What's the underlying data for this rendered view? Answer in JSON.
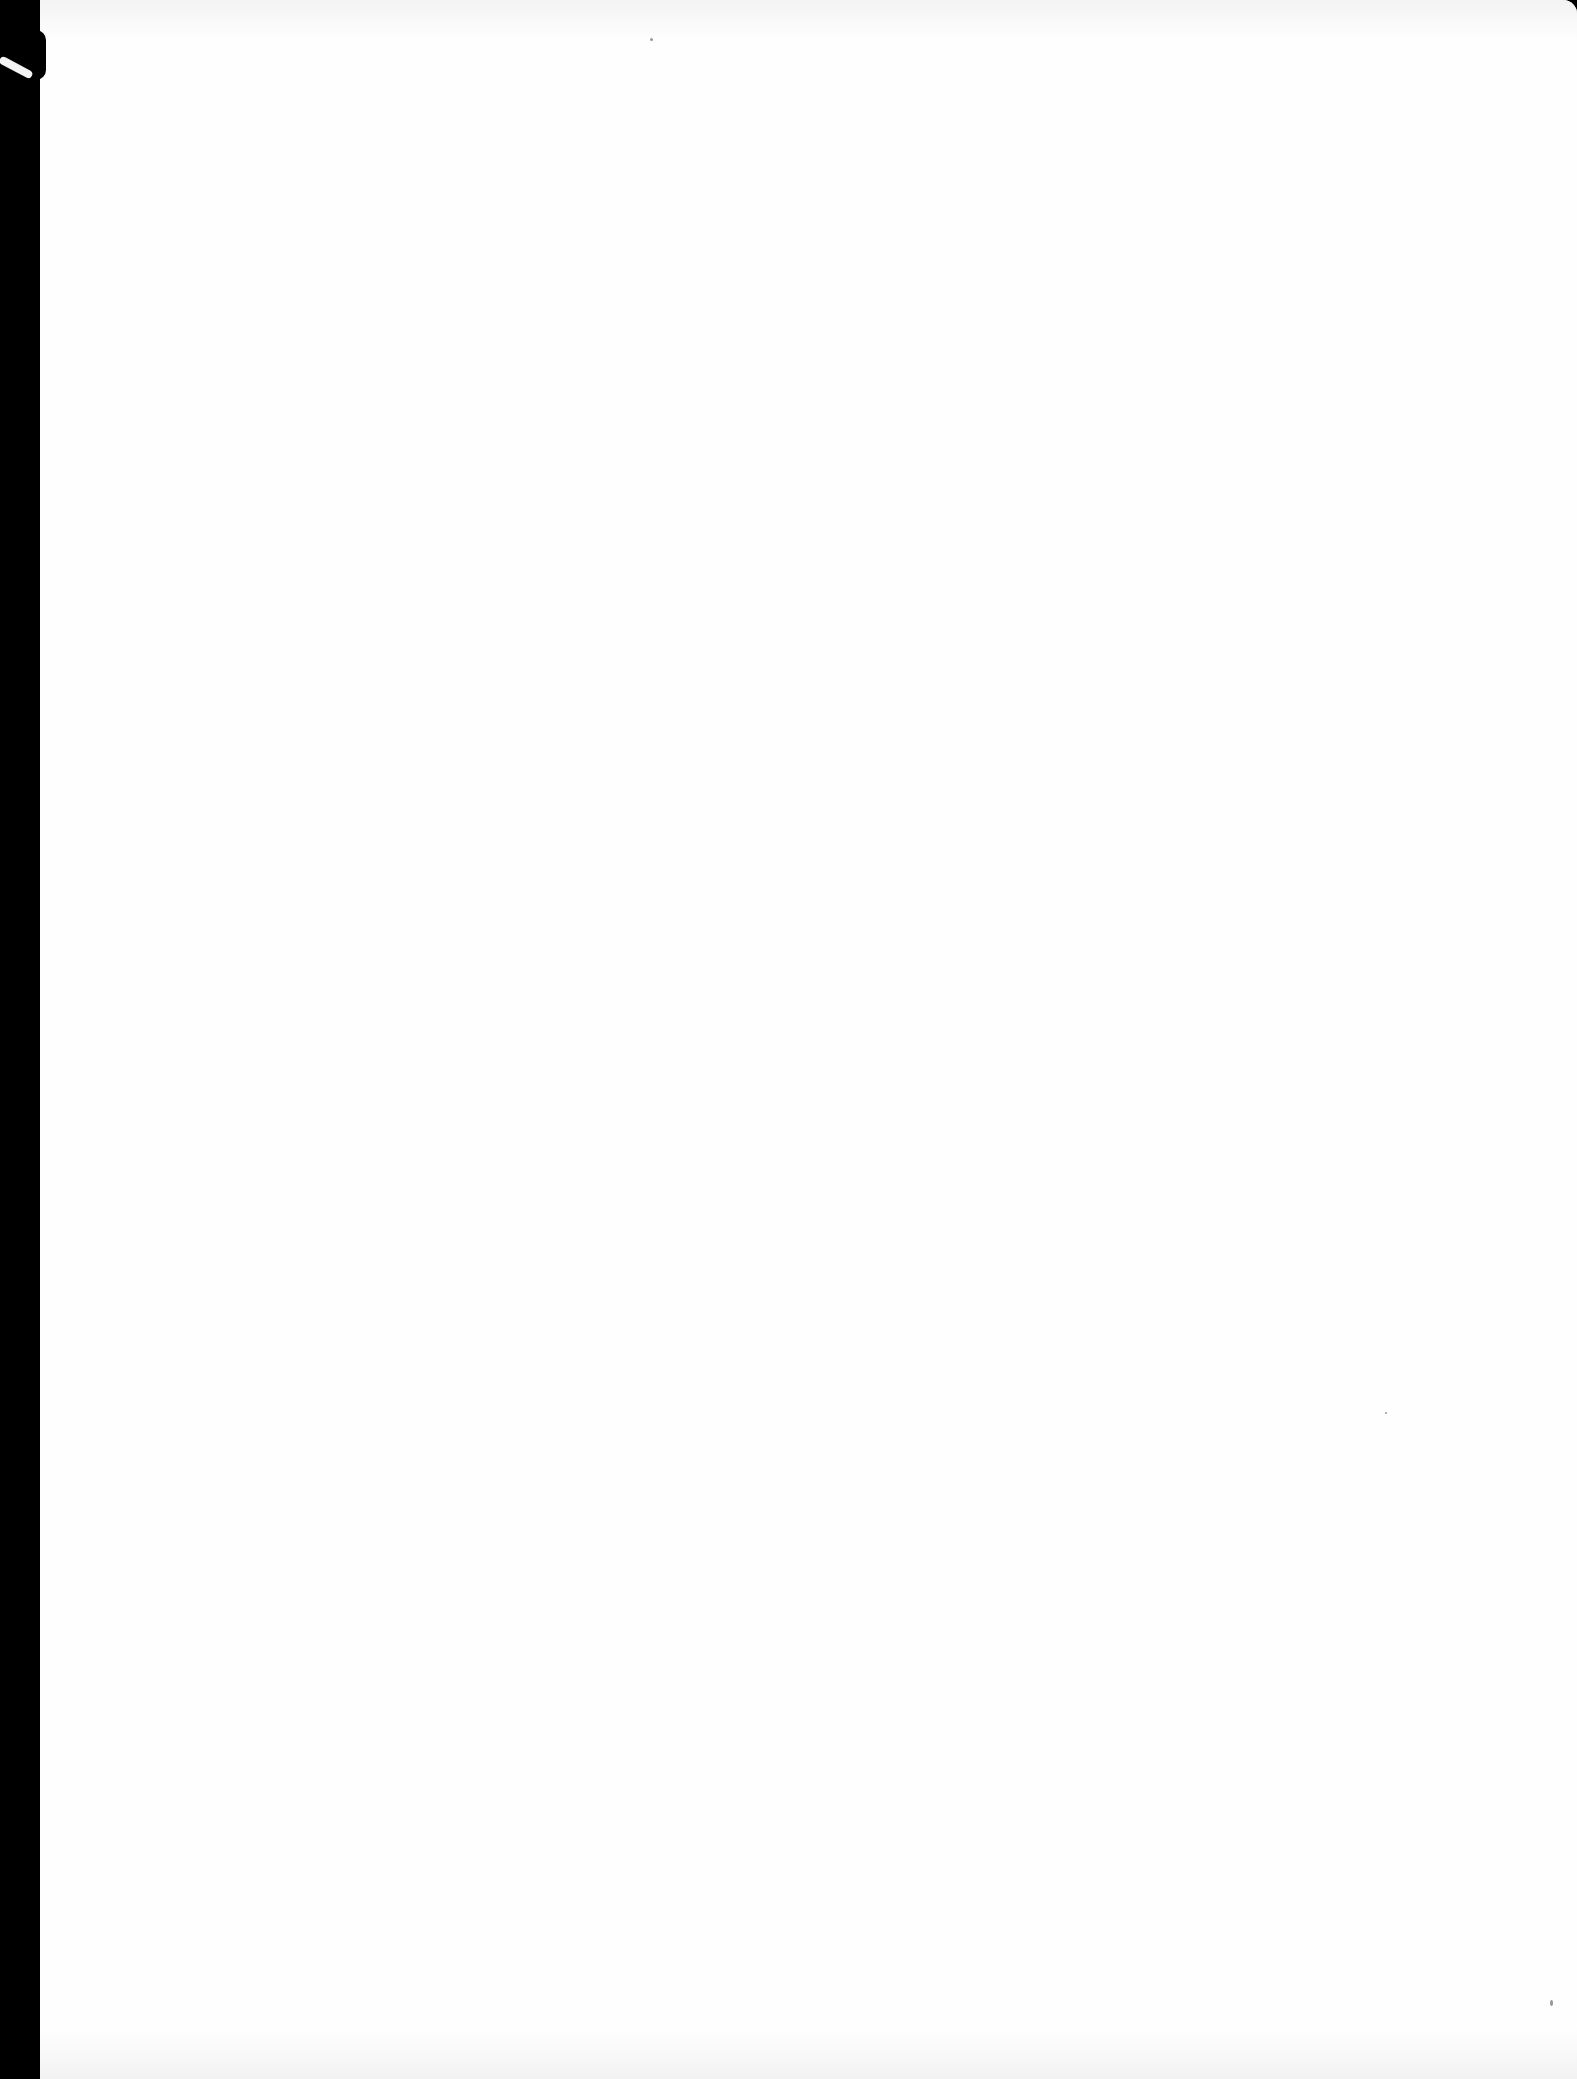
{
  "document": {
    "type": "scanned-page",
    "content": "",
    "colors": {
      "paper": "#fefefe",
      "scanner_background": "#000000"
    }
  }
}
